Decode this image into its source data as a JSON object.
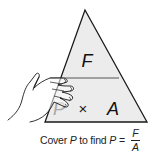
{
  "diagram": {
    "type": "formula-triangle",
    "top_variable": "F",
    "bottom_left_variable": "P",
    "bottom_operator": "×",
    "bottom_right_variable": "A",
    "covered_variable": "P",
    "colors": {
      "triangle_fill": "#ececec",
      "outline": "#1a1a1a",
      "divider": "#555555",
      "covered_text": "#a8a8a8"
    }
  },
  "caption": {
    "prefix": "Cover",
    "covered_var": "P",
    "middle": "to find",
    "result_var": "P",
    "equals": "=",
    "fraction": {
      "numerator": "F",
      "denominator": "A"
    }
  }
}
